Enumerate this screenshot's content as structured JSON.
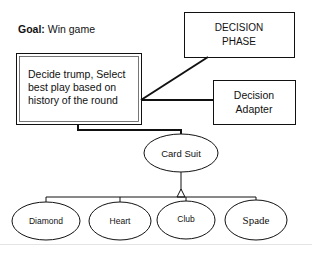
{
  "goal": {
    "label": "Goal:",
    "value": "Win game"
  },
  "nodes": {
    "main_task": {
      "text": "Decide trump, Select best play based on history of the round"
    },
    "decision_phase": {
      "line1": "DECISION",
      "line2": "PHASE"
    },
    "decision_adapter": {
      "line1": "Decision",
      "line2": "Adapter"
    },
    "card_suit": {
      "text": "Card Suit"
    },
    "suits": [
      {
        "label": "Diamond"
      },
      {
        "label": "Heart"
      },
      {
        "label": "Club"
      },
      {
        "label": "Spade"
      }
    ]
  },
  "colors": {
    "stroke": "#111111",
    "background": "#ffffff",
    "footer_line": "#e4e4e4"
  }
}
